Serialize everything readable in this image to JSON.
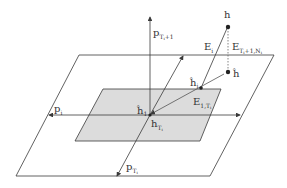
{
  "diagram": {
    "labels": {
      "p_ti_plus_1": "p",
      "p_ti_plus_1_sub": "T",
      "p_ti_plus_1_sub2": "i",
      "p_ti_plus_1_sub3": "+1",
      "p_i": "p",
      "p_i_sub": "i",
      "p_ti": "p",
      "p_ti_sub": "T",
      "p_ti_sub2": "i",
      "E_i": "E",
      "E_i_sub": "i",
      "E_tail": "E",
      "E_tail_sub": "T",
      "E_tail_sub2": "i",
      "E_tail_sub3": "+1,N",
      "E_tail_sub4": "i",
      "E_head": "E",
      "E_head_sub": "1,T",
      "E_head_sub2": "i",
      "h": "h",
      "h_hat": "ĥ",
      "h_hat_sym": "^",
      "h_i_hat": "ĥ",
      "h_i_hat_sub": "i",
      "h_1_hat": "ĥ",
      "h_1_hat_sub": "1",
      "h_ti": "h",
      "h_ti_sub": "T",
      "h_ti_sub2": "i"
    },
    "colors": {
      "line": "#3a3a3a",
      "shade": "#d9d9d9",
      "dotted": "#666666"
    }
  }
}
